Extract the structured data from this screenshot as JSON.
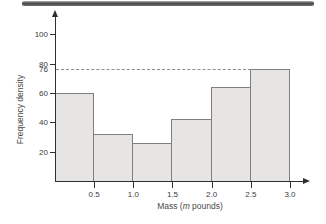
{
  "figure": {
    "kind": "textbook-histogram-figure",
    "top_band": {
      "present": true,
      "color_dark": "#474747",
      "color_light": "#b3b3b3"
    }
  },
  "colors": {
    "bar_fill": "#e6e5e3",
    "bar_border": "#7f7f7f",
    "axis": "#2f2f2f",
    "dashed": "#8c8c8c",
    "text": "#3b3b3b"
  },
  "chart_data": {
    "type": "bar",
    "subtype": "histogram",
    "title": "",
    "xlabel": "Mass (m pounds)",
    "xlabel_parts": {
      "pre": "Mass (",
      "italic": "m",
      "post": " pounds)"
    },
    "ylabel": "Frequency density",
    "categories": [
      "0-0.5",
      "0.5-1.0",
      "1.0-1.5",
      "1.5-2.0",
      "2.0-2.5",
      "2.5-3.0"
    ],
    "bin_edges": [
      0,
      0.5,
      1.0,
      1.5,
      2.0,
      2.5,
      3.0
    ],
    "values": [
      60,
      32,
      26,
      42,
      64,
      76
    ],
    "x_tick_values": [
      0.5,
      1.0,
      1.5,
      2.0,
      2.5,
      3.0
    ],
    "x_tick_labels": [
      "0.5",
      "1.0",
      "1.5",
      "2.0",
      "2.5",
      "3.0"
    ],
    "y_tick_values": [
      20,
      40,
      60,
      80,
      100
    ],
    "y_tick_labels": [
      "20",
      "40",
      "60",
      "80",
      "100"
    ],
    "dashed_line": {
      "value": 76,
      "label": "76"
    },
    "xlim": [
      0,
      3.35
    ],
    "ylim": [
      0,
      112
    ],
    "grid": false,
    "legend": false
  }
}
